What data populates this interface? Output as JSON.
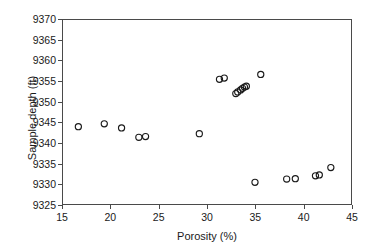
{
  "chart_data": {
    "type": "scatter",
    "title": "",
    "xlabel": "Porosity (%)",
    "ylabel": "Sample depth (ft)",
    "xlim": [
      15,
      45
    ],
    "ylim": [
      9325,
      9370
    ],
    "xticks": [
      15,
      20,
      25,
      30,
      35,
      40,
      45
    ],
    "yticks": [
      9325,
      9330,
      9335,
      9340,
      9345,
      9350,
      9355,
      9360,
      9365,
      9370
    ],
    "grid": false,
    "legend": null,
    "marker": "open-circle",
    "marker_color": "#1a1a1a",
    "series": [
      {
        "name": "samples",
        "x": [
          16.6,
          19.3,
          21.1,
          22.9,
          23.6,
          29.2,
          31.3,
          31.8,
          33.0,
          33.2,
          33.5,
          33.7,
          33.9,
          34.1,
          35.6,
          35.0,
          38.3,
          39.2,
          41.3,
          41.7,
          42.9
        ],
        "y": [
          9343.9,
          9344.6,
          9343.6,
          9341.3,
          9341.5,
          9342.2,
          9355.5,
          9355.8,
          9352.0,
          9352.4,
          9352.9,
          9353.3,
          9353.6,
          9353.8,
          9356.7,
          9330.3,
          9331.1,
          9331.2,
          9331.9,
          9332.1,
          9333.9
        ]
      }
    ]
  },
  "axes": {
    "x_title": "Porosity (%)",
    "y_title": "Sample depth (ft)",
    "x_tick_labels": [
      "15",
      "20",
      "25",
      "30",
      "35",
      "40",
      "45"
    ],
    "y_tick_labels": [
      "9325",
      "9330",
      "9335",
      "9340",
      "9345",
      "9350",
      "9355",
      "9360",
      "9365",
      "9370"
    ]
  }
}
